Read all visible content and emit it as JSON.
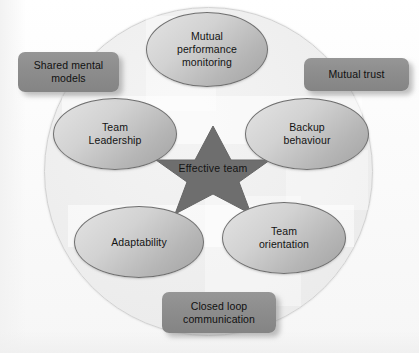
{
  "diagram": {
    "center": {
      "shape": "star",
      "label": "Effective team",
      "fill_color": "#6e6e6e"
    },
    "background": {
      "shape": "circle",
      "fill_color": "#eeeeee",
      "border_color": "#d2d2d2"
    },
    "ellipses": [
      {
        "id": "mutual-performance-monitoring",
        "label": "Mutual\nperformance\nmonitoring",
        "position": "top"
      },
      {
        "id": "team-leadership",
        "label": "Team\nLeadership",
        "position": "left"
      },
      {
        "id": "backup-behaviour",
        "label": "Backup\nbehaviour",
        "position": "right"
      },
      {
        "id": "adaptability",
        "label": "Adaptability",
        "position": "bottom-left"
      },
      {
        "id": "team-orientation",
        "label": "Team\norientation",
        "position": "bottom-right"
      }
    ],
    "boxes": [
      {
        "id": "shared-mental-models",
        "label": "Shared mental\nmodels",
        "position": "top-left"
      },
      {
        "id": "mutual-trust",
        "label": "Mutual trust",
        "position": "top-right"
      },
      {
        "id": "closed-loop-communication",
        "label": "Closed loop\ncommunication",
        "position": "bottom-center"
      }
    ],
    "colors": {
      "ellipse_fill_light": "#e4e4e4",
      "ellipse_fill_dark": "#a3a3a3",
      "ellipse_border": "#6f6f6f",
      "box_fill": "#8d8d8d",
      "star_fill": "#6e6e6e",
      "text": "#131313",
      "page_background": "#fdfdfd"
    }
  }
}
